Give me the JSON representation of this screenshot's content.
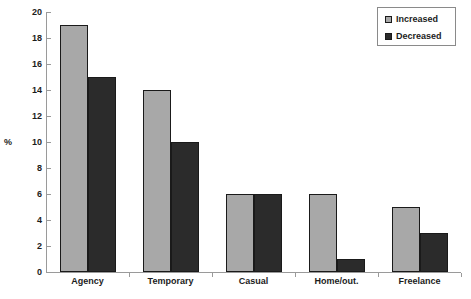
{
  "chart_data": {
    "type": "bar",
    "title": "",
    "subtitle": "",
    "xlabel": "",
    "ylabel": "%",
    "ylim": [
      0,
      20
    ],
    "ytick_step": 2,
    "yticks": [
      "0",
      "2",
      "4",
      "6",
      "8",
      "10",
      "12",
      "14",
      "16",
      "18",
      "20"
    ],
    "grid": false,
    "legend_position": "top-right",
    "categories": [
      "Agency",
      "Temporary",
      "Casual",
      "Home/out.",
      "Freelance"
    ],
    "series": [
      {
        "name": "Increased",
        "color": "#a8a8a8",
        "values": [
          19,
          14,
          6,
          6,
          5
        ]
      },
      {
        "name": "Decreased",
        "color": "#2b2b2b",
        "values": [
          15,
          10,
          6,
          1,
          3
        ]
      }
    ]
  },
  "legend": {
    "items": [
      {
        "label": "Increased",
        "swatch": "increased"
      },
      {
        "label": "Decreased",
        "swatch": "decreased"
      }
    ]
  },
  "axes": {
    "y_axis_label": "%"
  }
}
